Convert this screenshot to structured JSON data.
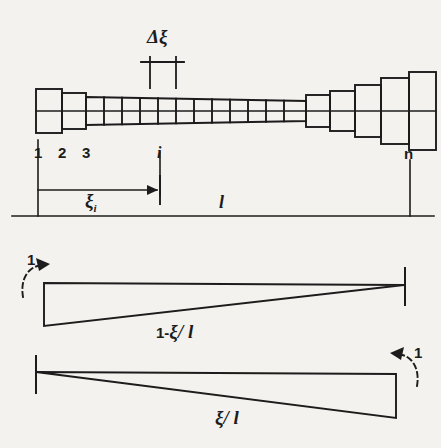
{
  "figure": {
    "ink_color": "#1c1c1c",
    "background_color": "#f4f2ee"
  },
  "beam": {
    "delta_label": "Δξ",
    "node_labels": [
      "1",
      "2",
      "3"
    ],
    "node_i_label": "i",
    "node_n_label": "n",
    "segment_count": 20
  },
  "dimensions": {
    "xi_i_label": "ξ",
    "xi_i_subscript": "i",
    "length_label": "l"
  },
  "diagram_upper": {
    "formula_lead": "1-",
    "formula_xi": "ξ",
    "formula_slash_l": "/ l",
    "rotation_label": "1"
  },
  "diagram_lower": {
    "formula_xi": "ξ",
    "formula_slash_l": "/ l",
    "rotation_label": "1"
  }
}
